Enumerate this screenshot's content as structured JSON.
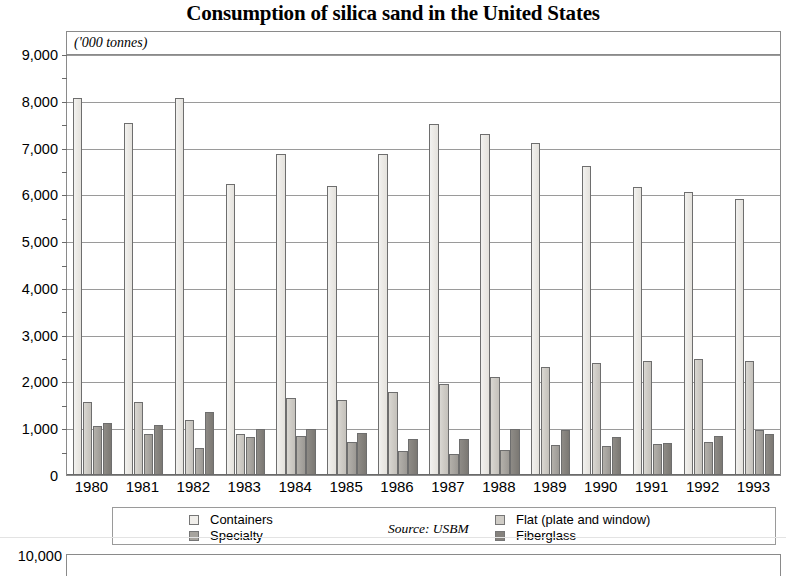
{
  "title": "Consumption of silica sand in the United States",
  "units_caption": "('000 tonnes)",
  "source_note": "Source: USBM",
  "legend": {
    "left_column": [
      {
        "label": "Containers",
        "series": "containers"
      },
      {
        "label": "Specialty",
        "series": "specialty"
      }
    ],
    "right_column": [
      {
        "label": "Flat (plate and window)",
        "series": "flat"
      },
      {
        "label": "Fiberglass",
        "series": "fiberglass"
      }
    ]
  },
  "y_axis": {
    "tick_labels": [
      "9,000",
      "8,000",
      "7,000",
      "6,000",
      "5,000",
      "4,000",
      "3,000",
      "2,000",
      "1,000",
      "0"
    ]
  },
  "next_figure": {
    "y_top_label": "10,000"
  },
  "colors": {
    "containers": "#f0eeea",
    "flat": "#cfccc6",
    "specialty": "#a7a49e",
    "fiberglass": "#85827d",
    "grid": "#9a9a9a",
    "axis": "#6a6a6a"
  },
  "chart_data": {
    "type": "bar",
    "title": "Consumption of silica sand in the United States",
    "subtitle": "('000 tonnes)",
    "xlabel": "",
    "ylabel": "('000 tonnes)",
    "ylim": [
      0,
      9000
    ],
    "ytick_step": 1000,
    "ytick_labels": [
      "0",
      "1,000",
      "2,000",
      "3,000",
      "4,000",
      "5,000",
      "6,000",
      "7,000",
      "8,000",
      "9,000"
    ],
    "minor_gridlines": true,
    "minor_gridline_step": 500,
    "grid": true,
    "legend_position": "below-plot",
    "annotations": [
      "Source: USBM"
    ],
    "categories": [
      "1980",
      "1981",
      "1982",
      "1983",
      "1984",
      "1985",
      "1986",
      "1987",
      "1988",
      "1989",
      "1990",
      "1991",
      "1992",
      "1993"
    ],
    "series": [
      {
        "name": "Containers",
        "color": "#f0eeea",
        "values": [
          8050,
          7530,
          8060,
          6230,
          6870,
          6180,
          6860,
          7500,
          7280,
          7100,
          6610,
          6150,
          6050,
          5900
        ]
      },
      {
        "name": "Flat (plate and window)",
        "color": "#cfccc6",
        "values": [
          1560,
          1560,
          1170,
          880,
          1650,
          1610,
          1770,
          1940,
          2100,
          2310,
          2400,
          2440,
          2480,
          2440
        ]
      },
      {
        "name": "Specialty",
        "color": "#a7a49e",
        "values": [
          1040,
          880,
          580,
          820,
          830,
          700,
          510,
          450,
          540,
          650,
          630,
          660,
          700,
          960
        ]
      },
      {
        "name": "Fiberglass",
        "color": "#85827d",
        "values": [
          1120,
          1060,
          1340,
          990,
          990,
          900,
          780,
          760,
          990,
          970,
          810,
          680,
          830,
          870
        ]
      }
    ]
  }
}
